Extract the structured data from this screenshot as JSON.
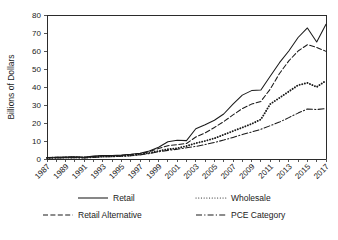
{
  "chart_data": {
    "type": "line",
    "title": "",
    "xlabel": "",
    "ylabel": "Billions of Dollars",
    "xlim": [
      1987,
      2017
    ],
    "ylim": [
      0,
      80
    ],
    "grid": false,
    "legend_position": "bottom",
    "ytick_labels": [
      "0",
      "10",
      "20",
      "30",
      "40",
      "50",
      "60",
      "70",
      "80"
    ],
    "ytick_values": [
      0,
      10,
      20,
      30,
      40,
      50,
      60,
      70,
      80
    ],
    "xtick_labels": [
      "1987",
      "1989",
      "1991",
      "1993",
      "1995",
      "1997",
      "1999",
      "2001",
      "2003",
      "2005",
      "2007",
      "2009",
      "2011",
      "2013",
      "2015",
      "2017"
    ],
    "xtick_values": [
      1987,
      1989,
      1991,
      1993,
      1995,
      1997,
      1999,
      2001,
      2003,
      2005,
      2007,
      2009,
      2011,
      2013,
      2015,
      2017
    ],
    "x": [
      1987,
      1988,
      1989,
      1990,
      1991,
      1992,
      1993,
      1994,
      1995,
      1996,
      1997,
      1998,
      1999,
      2000,
      2001,
      2002,
      2003,
      2004,
      2005,
      2006,
      2007,
      2008,
      2009,
      2010,
      2011,
      2012,
      2013,
      2014,
      2015,
      2016,
      2017
    ],
    "series": [
      {
        "name": "Retail",
        "style": "solid",
        "values": [
          0.8,
          1.0,
          1.1,
          1.2,
          1.0,
          1.6,
          2.0,
          2.0,
          2.2,
          2.6,
          3.2,
          4.4,
          6.5,
          9.6,
          10.4,
          10.2,
          16.8,
          19.0,
          21.5,
          25.0,
          30.5,
          35.5,
          38.0,
          38.3,
          46.0,
          53.5,
          60.0,
          67.5,
          72.8,
          65.0,
          74.8
        ]
      },
      {
        "name": "Retail Alternative",
        "style": "dashed",
        "values": [
          0.7,
          0.9,
          1.0,
          1.1,
          0.9,
          1.4,
          1.8,
          1.8,
          2.0,
          2.4,
          3.0,
          4.1,
          5.8,
          7.4,
          8.0,
          8.6,
          12.2,
          14.5,
          17.5,
          20.8,
          24.5,
          28.0,
          30.5,
          32.0,
          38.8,
          47.5,
          54.5,
          60.0,
          63.5,
          62.0,
          59.8
        ]
      },
      {
        "name": "Wholesale",
        "style": "dotted",
        "values": [
          0.6,
          0.7,
          0.8,
          0.9,
          0.8,
          1.1,
          1.4,
          1.5,
          1.7,
          2.0,
          2.6,
          3.4,
          4.4,
          5.4,
          6.0,
          7.2,
          8.8,
          10.0,
          11.5,
          13.5,
          15.5,
          17.5,
          19.5,
          22.0,
          30.5,
          34.0,
          37.5,
          41.0,
          42.3,
          40.0,
          43.5
        ]
      },
      {
        "name": "PCE Category",
        "style": "dashdot",
        "values": [
          0.5,
          0.6,
          0.7,
          0.8,
          0.6,
          0.9,
          1.2,
          1.3,
          1.5,
          1.8,
          2.3,
          3.0,
          4.0,
          4.8,
          5.4,
          6.2,
          7.0,
          8.0,
          9.2,
          10.5,
          12.0,
          13.6,
          15.0,
          16.5,
          18.5,
          20.5,
          23.0,
          25.5,
          27.8,
          27.5,
          28.0
        ]
      }
    ]
  },
  "legend": {
    "items": [
      {
        "label": "Retail",
        "style": "solid"
      },
      {
        "label": "Wholesale",
        "style": "dotted"
      },
      {
        "label": "Retail Alternative",
        "style": "dashed"
      },
      {
        "label": "PCE Category",
        "style": "dashdot"
      }
    ]
  }
}
